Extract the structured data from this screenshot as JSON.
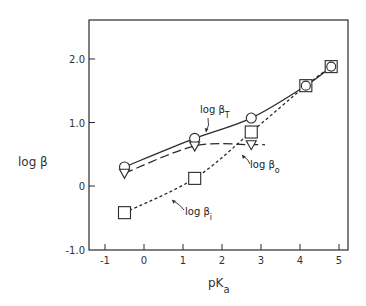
{
  "chart_data": {
    "type": "line",
    "title": "",
    "xlabel": "pK",
    "xlabel_sub": "a",
    "ylabel": "log β",
    "xlim": [
      -1.4,
      5.2
    ],
    "ylim": [
      -1.0,
      2.7
    ],
    "xticks": [
      -1,
      0,
      1,
      2,
      3,
      4,
      5
    ],
    "xtick_labels": [
      "-1",
      "0",
      "1",
      "2",
      "3",
      "4",
      "5"
    ],
    "yticks": [
      -1.0,
      0,
      1.0,
      2.0
    ],
    "ytick_labels": [
      "-1.0",
      "0",
      "1.0",
      "2.0"
    ],
    "grid": false,
    "legend": "none (inline annotations)",
    "series": [
      {
        "name": "log βT",
        "label_main": "log β",
        "label_sub": "T",
        "marker": "circle",
        "line": "solid",
        "x": [
          -0.5,
          1.3,
          2.75,
          4.15,
          4.8
        ],
        "values": [
          0.3,
          0.75,
          1.07,
          1.58,
          1.88
        ]
      },
      {
        "name": "log βo",
        "label_main": "log β",
        "label_sub": "o",
        "marker": "triangle-down",
        "line": "long-dash",
        "x": [
          -0.5,
          1.3,
          2.75
        ],
        "values": [
          0.2,
          0.63,
          0.65
        ],
        "line_extends_to_x": 3.1
      },
      {
        "name": "log βi",
        "label_main": "log β",
        "label_sub": "i",
        "marker": "square",
        "line": "short-dash",
        "x": [
          -0.5,
          1.3,
          2.75,
          4.15,
          4.8
        ],
        "values": [
          -0.42,
          0.12,
          0.85,
          1.58,
          1.88
        ]
      }
    ]
  }
}
